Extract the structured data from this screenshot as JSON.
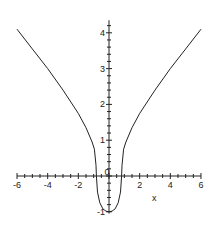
{
  "chart_data": {
    "type": "line",
    "title": "",
    "xlabel": "x",
    "ylabel": "",
    "xlim": [
      -6,
      6
    ],
    "ylim": [
      -1,
      4.2
    ],
    "x_ticks": [
      "-6",
      "-4",
      "-2",
      "0",
      "2",
      "4",
      "6"
    ],
    "y_ticks": [
      "-1",
      "1",
      "2",
      "3",
      "4"
    ],
    "grid": false,
    "series": [
      {
        "name": "curve",
        "x": [
          -6,
          -5,
          -4,
          -3,
          -2,
          -1.5,
          -1.1,
          -0.95,
          -0.85,
          -0.82,
          -0.75,
          -0.6,
          -0.4,
          -0.2,
          0,
          0.2,
          0.4,
          0.6,
          0.75,
          0.82,
          0.85,
          0.95,
          1.1,
          1.5,
          2,
          3,
          4,
          5,
          6
        ],
        "y": [
          4.1,
          3.55,
          3.0,
          2.4,
          1.75,
          1.35,
          0.95,
          0.75,
          0.3,
          0,
          -0.45,
          -0.75,
          -0.92,
          -0.98,
          -1.0,
          -0.98,
          -0.92,
          -0.75,
          -0.45,
          0,
          0.3,
          0.75,
          0.95,
          1.35,
          1.75,
          2.4,
          3.0,
          3.55,
          4.1
        ]
      }
    ]
  }
}
